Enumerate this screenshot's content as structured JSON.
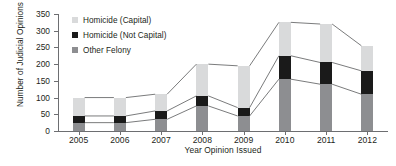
{
  "chart_data": {
    "type": "bar",
    "subtype": "stacked-bar-with-connectors",
    "title": "",
    "xlabel": "Year Opinion Issued",
    "ylabel": "Number of Judicial Opinions",
    "categories": [
      "2005",
      "2006",
      "2007",
      "2008",
      "2009",
      "2010",
      "2011",
      "2012"
    ],
    "ylim": [
      0,
      350
    ],
    "yticks": [
      0,
      50,
      100,
      150,
      200,
      250,
      300,
      350
    ],
    "grid": false,
    "legend_position": "top-left-inside",
    "series": [
      {
        "name": "Other Felony",
        "color": "#8d8e91",
        "values": [
          25,
          25,
          35,
          75,
          45,
          155,
          140,
          110
        ]
      },
      {
        "name": "Homicide (Not Capital)",
        "color": "#1a1a1a",
        "values": [
          20,
          20,
          25,
          30,
          25,
          70,
          65,
          70
        ]
      },
      {
        "name": "Homicide (Capital)",
        "color": "#d9dadb",
        "values": [
          55,
          55,
          50,
          95,
          125,
          100,
          115,
          75
        ]
      }
    ],
    "totals": [
      100,
      100,
      110,
      200,
      195,
      325,
      320,
      255
    ],
    "annotations": []
  },
  "legend": {
    "items": [
      {
        "label": "Homicide (Capital)",
        "swatch": "#d9dadb"
      },
      {
        "label": "Homicide (Not Capital)",
        "swatch": "#1a1a1a"
      },
      {
        "label": "Other Felony",
        "swatch": "#8d8e91"
      }
    ]
  },
  "axes": {
    "y_title": "Number of Judicial Opinions",
    "x_title": "Year Opinion Issued",
    "y_tick_labels": [
      "0",
      "50",
      "100",
      "150",
      "200",
      "250",
      "300",
      "350"
    ],
    "x_tick_labels": [
      "2005",
      "2006",
      "2007",
      "2008",
      "2009",
      "2010",
      "2011",
      "2012"
    ]
  }
}
